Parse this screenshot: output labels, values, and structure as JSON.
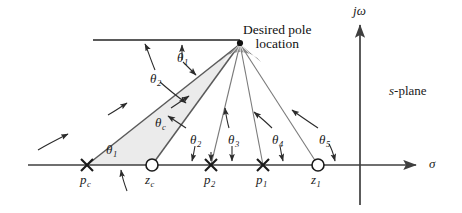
{
  "figure": {
    "background": "#ffffff",
    "line_color": "#3f3f3f",
    "shade_color": "#e8e8e8",
    "text_color": "#1a1a1a"
  },
  "annotations": {
    "desired_pole_line1": "Desired pole",
    "desired_pole_line2": "location",
    "s_plane_prefix": "s",
    "s_plane_suffix": "-plane"
  },
  "axes": {
    "real_label": "σ",
    "imag_label_j": "j",
    "imag_label_omega": "ω"
  },
  "angles": [
    {
      "name": "theta-1-top",
      "symbol": "θ",
      "sub": "1",
      "x": 177,
      "y": 51
    },
    {
      "name": "theta-2-top",
      "symbol": "θ",
      "sub": "2",
      "x": 150,
      "y": 72
    },
    {
      "name": "theta-c",
      "symbol": "θ",
      "sub": "c",
      "x": 155,
      "y": 116
    },
    {
      "name": "theta-1-bottom",
      "symbol": "θ",
      "sub": "1",
      "x": 106,
      "y": 143
    },
    {
      "name": "theta-2-bottom",
      "symbol": "θ",
      "sub": "2",
      "x": 190,
      "y": 133
    },
    {
      "name": "theta-3",
      "symbol": "θ",
      "sub": "3",
      "x": 228,
      "y": 133
    },
    {
      "name": "theta-4",
      "symbol": "θ",
      "sub": "4",
      "x": 272,
      "y": 133
    },
    {
      "name": "theta-5",
      "symbol": "θ",
      "sub": "5",
      "x": 319,
      "y": 133
    }
  ],
  "singularities": [
    {
      "name": "pole-pc",
      "type": "pole",
      "symbol": "p",
      "sub": "c",
      "x": 87,
      "label_x": 80,
      "label_y": 173
    },
    {
      "name": "zero-zc",
      "type": "zero",
      "symbol": "z",
      "sub": "c",
      "x": 152,
      "label_x": 145,
      "label_y": 173
    },
    {
      "name": "pole-p2",
      "type": "pole",
      "symbol": "p",
      "sub": "2",
      "x": 211,
      "label_x": 204,
      "label_y": 173
    },
    {
      "name": "pole-p1",
      "type": "pole",
      "symbol": "p",
      "sub": "1",
      "x": 263,
      "label_x": 256,
      "label_y": 173
    },
    {
      "name": "zero-z1",
      "type": "zero",
      "symbol": "z",
      "sub": "1",
      "x": 318,
      "label_x": 311,
      "label_y": 173
    }
  ],
  "desired_pole": {
    "x": 240,
    "y": 44
  },
  "real_axis": {
    "y": 165,
    "x_start": 28,
    "x_end": 422
  },
  "imag_axis": {
    "x": 360,
    "y_top": 20,
    "y_bottom": 205
  }
}
